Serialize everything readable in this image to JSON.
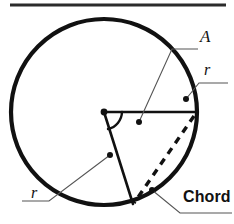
{
  "figure": {
    "type": "geometry-diagram",
    "background_color": "#ffffff",
    "stroke_color": "#111111",
    "top_rule": {
      "name": "horizontal-rule",
      "x1": 10,
      "x2": 226,
      "y": 5,
      "thickness": 3
    },
    "circle": {
      "center_x": 104,
      "center_y": 112,
      "radius": 93,
      "stroke_width": 4.2
    },
    "center_point": {
      "x": 104,
      "y": 112,
      "dot_radius": 3.2
    },
    "radii": [
      {
        "name": "horizontal-radius",
        "x1": 104,
        "y1": 112,
        "x2": 197,
        "y2": 112,
        "stroke_width": 2.6
      },
      {
        "name": "lower-radius",
        "x1": 104,
        "y1": 112,
        "x2": 133,
        "y2": 204,
        "stroke_width": 2.6
      }
    ],
    "angle_arc": {
      "name": "central-angle-arc",
      "path": "M 122 112 A 18 18 0 0 1 108 129",
      "stroke_width": 2.4
    },
    "chord_line": {
      "name": "chord-dashed-line",
      "x1": 194,
      "y1": 116,
      "x2": 134,
      "y2": 203,
      "stroke_width": 3.4,
      "dash": "7 6"
    },
    "leaders": [
      {
        "name": "leader-A",
        "points": "198,49 172,49 139,122",
        "dot_x": 139,
        "dot_y": 122
      },
      {
        "name": "leader-r-top",
        "points": "224,83 199,83 186,99",
        "dot_x": 186,
        "dot_y": 99
      },
      {
        "name": "leader-r-bottom",
        "points": "25,201 49,201 110,155",
        "dot_x": 110,
        "dot_y": 155
      },
      {
        "name": "leader-chord",
        "points": "228,212 178,212 152,190",
        "dot_x": 152,
        "dot_y": 190
      }
    ]
  },
  "labels": {
    "angle": "A",
    "radius_top": "r",
    "radius_bottom": "r",
    "chord": "Chord"
  }
}
